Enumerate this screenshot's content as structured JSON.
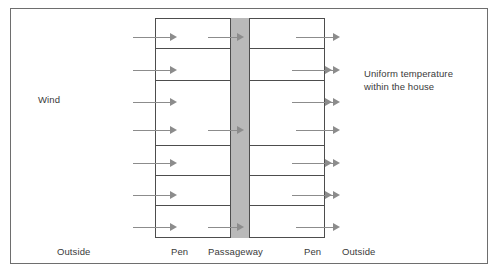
{
  "diagram": {
    "labels": {
      "wind": "Wind",
      "uniform_temp_line1": "Uniform temperature",
      "uniform_temp_line2": "within the house",
      "outside_left": "Outside",
      "pen_left": "Pen",
      "passageway": "Passageway",
      "pen_right": "Pen",
      "outside_right": "Outside"
    },
    "colors": {
      "frame_border": "#6e6e6e",
      "house_border": "#4d4d4d",
      "passageway_fill": "#b9b9b9",
      "arrow": "#8c8c8c",
      "text": "#3a3a3a",
      "background": "#ffffff"
    },
    "geometry": {
      "frame": {
        "x": 10,
        "y": 8,
        "width": 478,
        "height": 256
      },
      "house": {
        "x": 155,
        "y": 18,
        "width": 170,
        "height": 220
      },
      "passageway": {
        "x": 230,
        "y": 18,
        "width": 20,
        "height": 220
      }
    },
    "dividers_y": [
      48,
      80,
      145,
      175,
      205
    ],
    "arrow_rows": [
      {
        "y": 37,
        "passage_arrow": true
      },
      {
        "y": 70,
        "passage_arrow": false
      },
      {
        "y": 102,
        "passage_arrow": false
      },
      {
        "y": 130,
        "passage_arrow": true
      },
      {
        "y": 163,
        "passage_arrow": false
      },
      {
        "y": 195,
        "passage_arrow": false
      },
      {
        "y": 227,
        "passage_arrow": true
      }
    ],
    "arrow_segments": {
      "inflow": {
        "x": 133,
        "length": 44
      },
      "pen_left_out": {
        "x": 292,
        "length": 40
      },
      "passage_in": {
        "x": 208,
        "length": 36
      },
      "outflow": {
        "x": 296,
        "length": 44
      }
    }
  }
}
